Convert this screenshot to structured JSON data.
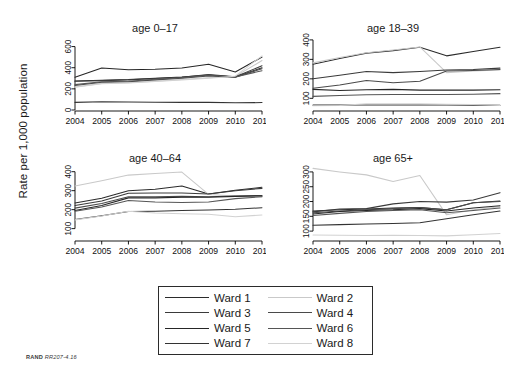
{
  "figure": {
    "ylabel": "Rate per 1,000 population",
    "footer_brand": "RAND",
    "footer_id": "RR207-4.16"
  },
  "legend": {
    "items": [
      {
        "label": "Ward 1",
        "color": "#2b2b2b"
      },
      {
        "label": "Ward 2",
        "color": "#c9c9c9"
      },
      {
        "label": "Ward 3",
        "color": "#3a3a3a"
      },
      {
        "label": "Ward 4",
        "color": "#4a4a4a"
      },
      {
        "label": "Ward 5",
        "color": "#262626"
      },
      {
        "label": "Ward 6",
        "color": "#555555"
      },
      {
        "label": "Ward 7",
        "color": "#333333"
      },
      {
        "label": "Ward 8",
        "color": "#d2d2d2"
      }
    ]
  },
  "chart_data": {
    "type": "line",
    "title": "",
    "xlabel": "",
    "ylabel": "Rate per 1,000 population",
    "grid": false,
    "legend_position": "bottom",
    "x": [
      2004,
      2005,
      2006,
      2007,
      2008,
      2009,
      2010,
      2011
    ],
    "panels": [
      {
        "title": "age 0–17",
        "ylim": [
          0,
          700
        ],
        "yticks": [
          0,
          200,
          400,
          600
        ],
        "series": [
          {
            "name": "Ward 1",
            "color": "#2b2b2b",
            "values": [
              275,
              282,
              288,
              300,
              312,
              330,
              312,
              400
            ]
          },
          {
            "name": "Ward 2",
            "color": "#c9c9c9",
            "values": [
              218,
              252,
              258,
              272,
              288,
              305,
              318,
              468
            ]
          },
          {
            "name": "Ward 3",
            "color": "#3a3a3a",
            "values": [
              272,
              278,
              285,
              298,
              310,
              335,
              315,
              418
            ]
          },
          {
            "name": "Ward 4",
            "color": "#4a4a4a",
            "values": [
              232,
              262,
              268,
              285,
              300,
              322,
              310,
              390
            ]
          },
          {
            "name": "Ward 5",
            "color": "#262626",
            "values": [
              310,
              398,
              380,
              385,
              398,
              432,
              360,
              500
            ]
          },
          {
            "name": "Ward 6",
            "color": "#555555",
            "values": [
              240,
              268,
              272,
              290,
              305,
              328,
              312,
              372
            ]
          },
          {
            "name": "Ward 7",
            "color": "#333333",
            "values": [
              72,
              78,
              76,
              74,
              72,
              72,
              68,
              70
            ]
          },
          {
            "name": "Ward 8",
            "color": "#d2d2d2",
            "values": [
              215,
              248,
              255,
              270,
              285,
              300,
              320,
              512
            ]
          }
        ]
      },
      {
        "title": "age 18–39",
        "ylim": [
          40,
          420
        ],
        "yticks": [
          100,
          200,
          300,
          400
        ],
        "series": [
          {
            "name": "Ward 1",
            "color": "#2b2b2b",
            "values": [
              275,
              305,
              332,
              345,
              362,
              318,
              340,
              362
            ]
          },
          {
            "name": "Ward 2",
            "color": "#c9c9c9",
            "values": [
              282,
              310,
              334,
              348,
              364,
              232,
              240,
              246
            ]
          },
          {
            "name": "Ward 3",
            "color": "#3a3a3a",
            "values": [
              200,
              218,
              238,
              232,
              238,
              245,
              248,
              255
            ]
          },
          {
            "name": "Ward 4",
            "color": "#4a4a4a",
            "values": [
              152,
              168,
              192,
              180,
              188,
              240,
              243,
              248
            ]
          },
          {
            "name": "Ward 5",
            "color": "#262626",
            "values": [
              146,
              140,
              144,
              146,
              142,
              142,
              142,
              144
            ]
          },
          {
            "name": "Ward 6",
            "color": "#555555",
            "values": [
              110,
              114,
              118,
              120,
              120,
              120,
              121,
              124
            ]
          },
          {
            "name": "Ward 7",
            "color": "#333333",
            "values": [
              65,
              66,
              66,
              66,
              66,
              66,
              65,
              64
            ]
          },
          {
            "name": "Ward 8",
            "color": "#d2d2d2",
            "values": [
              62,
              63,
              72,
              72,
              72,
              70,
              68,
              63
            ]
          }
        ]
      },
      {
        "title": "age 40–64",
        "ylim": [
          40,
          430
        ],
        "yticks": [
          100,
          200,
          300,
          400
        ],
        "series": [
          {
            "name": "Ward 1",
            "color": "#2b2b2b",
            "values": [
              235,
              260,
              300,
              308,
              325,
              282,
              302,
              318
            ]
          },
          {
            "name": "Ward 2",
            "color": "#c9c9c9",
            "values": [
              325,
              352,
              382,
              390,
              398,
              280,
              272,
              268
            ]
          },
          {
            "name": "Ward 3",
            "color": "#3a3a3a",
            "values": [
              222,
              246,
              286,
              288,
              288,
              282,
              300,
              312
            ]
          },
          {
            "name": "Ward 4",
            "color": "#4a4a4a",
            "values": [
              208,
              232,
              268,
              268,
              270,
              268,
              272,
              275
            ]
          },
          {
            "name": "Ward 5",
            "color": "#262626",
            "values": [
              196,
              222,
              262,
              262,
              265,
              265,
              270,
              272
            ]
          },
          {
            "name": "Ward 6",
            "color": "#555555",
            "values": [
              192,
              214,
              248,
              240,
              238,
              240,
              258,
              268
            ]
          },
          {
            "name": "Ward 7",
            "color": "#333333",
            "values": [
              148,
              168,
              190,
              192,
              196,
              198,
              202,
              210
            ]
          },
          {
            "name": "Ward 8",
            "color": "#d2d2d2",
            "values": [
              146,
              166,
              192,
              182,
              178,
              176,
              162,
              172
            ]
          }
        ]
      },
      {
        "title": "age 65+",
        "ylim": [
          70,
          320
        ],
        "yticks": [
          100,
          150,
          200,
          250,
          300
        ],
        "series": [
          {
            "name": "Ward 1",
            "color": "#2b2b2b",
            "values": [
              168,
              172,
              175,
              178,
              180,
              172,
              196,
              202
            ]
          },
          {
            "name": "Ward 2",
            "color": "#c9c9c9",
            "values": [
              312,
              300,
              290,
              268,
              288,
              155,
              172,
              182
            ]
          },
          {
            "name": "Ward 3",
            "color": "#3a3a3a",
            "values": [
              165,
              175,
              176,
              192,
              200,
              198,
              205,
              230
            ]
          },
          {
            "name": "Ward 4",
            "color": "#4a4a4a",
            "values": [
              162,
              168,
              172,
              176,
              180,
              172,
              196,
              200
            ]
          },
          {
            "name": "Ward 5",
            "color": "#262626",
            "values": [
              158,
              166,
              170,
              172,
              176,
              168,
              178,
              186
            ]
          },
          {
            "name": "Ward 6",
            "color": "#555555",
            "values": [
              153,
              160,
              166,
              170,
              172,
              162,
              170,
              178
            ]
          },
          {
            "name": "Ward 7",
            "color": "#333333",
            "values": [
              120,
              122,
              124,
              126,
              128,
              142,
              155,
              168
            ]
          },
          {
            "name": "Ward 8",
            "color": "#d2d2d2",
            "values": [
              87,
              86,
              85,
              86,
              85,
              84,
              88,
              92
            ]
          }
        ]
      }
    ]
  }
}
